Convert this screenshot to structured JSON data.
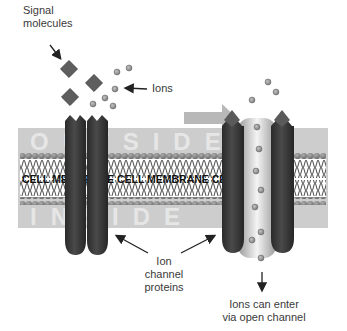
{
  "labels": {
    "signal_line1": "Signal",
    "signal_line2": "molecules",
    "ions": "Ions",
    "ion_channel_line1": "Ion",
    "ion_channel_line2": "channel",
    "ion_channel_line3": "proteins",
    "enter_line1": "Ions can enter",
    "enter_line2": "via open channel"
  },
  "membrane": {
    "band_text": "CELL MEMBRANE CELL MEMBRANE CELL ME",
    "outside_text": "OUTSIDE",
    "inside_text": "INSIDE"
  },
  "colors": {
    "background": "#ffffff",
    "membrane_band": "#c8c8c8",
    "head_group": "#8a8a8a",
    "channel_protein": "#3a3a3a",
    "ion": "#8f8f8f",
    "signal_molecule": "#6a6a6a",
    "arrow": "#222222"
  }
}
